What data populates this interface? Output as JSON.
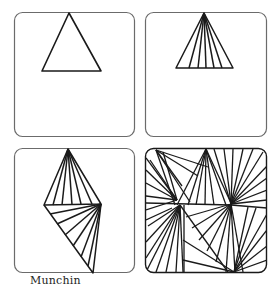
{
  "caption": "Munchin",
  "colors": {
    "frame": "#6b6b6b",
    "ink": "#1a1a1a",
    "background": "#ffffff"
  },
  "tiles": [
    {
      "id": "step-1",
      "description": "single outline triangle"
    },
    {
      "id": "step-2",
      "description": "triangle with lines fanning from apex"
    },
    {
      "id": "step-3",
      "description": "second fan triangle attached below"
    },
    {
      "id": "step-4",
      "description": "completed Munchin pattern"
    }
  ]
}
